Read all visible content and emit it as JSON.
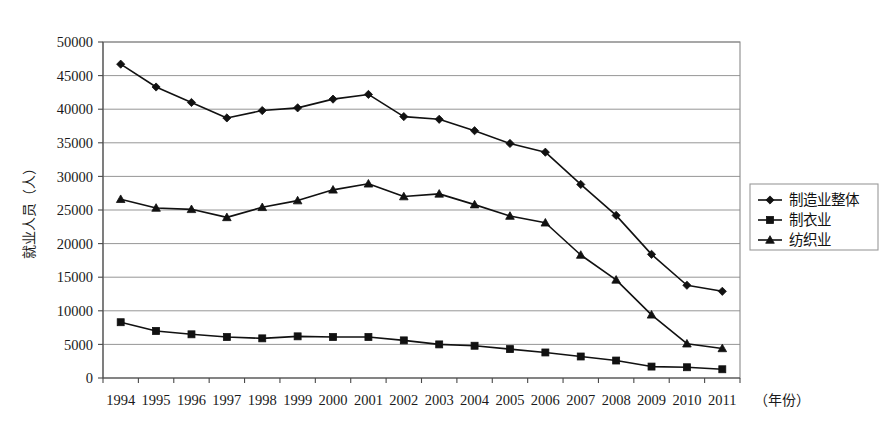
{
  "chart_data": {
    "type": "line",
    "title": "",
    "xlabel": "（年份）",
    "ylabel": "就业人员（人）",
    "categories": [
      "1994",
      "1995",
      "1996",
      "1997",
      "1998",
      "1999",
      "2000",
      "2001",
      "2002",
      "2003",
      "2004",
      "2005",
      "2006",
      "2007",
      "2008",
      "2009",
      "2010",
      "2011"
    ],
    "ylim": [
      0,
      50000
    ],
    "ytick_labels": [
      "50000",
      "45000",
      "40000",
      "35000",
      "30000",
      "25000",
      "20000",
      "15000",
      "10000",
      "5000",
      "0"
    ],
    "ytick_values": [
      50000,
      45000,
      40000,
      35000,
      30000,
      25000,
      20000,
      15000,
      10000,
      5000,
      0
    ],
    "grid": true,
    "legend_position": "right",
    "series": [
      {
        "name": "制造业整体",
        "marker": "diamond",
        "values": [
          46700,
          43300,
          41000,
          38700,
          39800,
          40200,
          41500,
          42200,
          38900,
          38500,
          36800,
          34900,
          33600,
          28800,
          24200,
          18400,
          13800,
          12900
        ]
      },
      {
        "name": "制衣业",
        "marker": "square",
        "values": [
          8300,
          7000,
          6500,
          6100,
          5900,
          6200,
          6100,
          6100,
          5600,
          5000,
          4800,
          4300,
          3800,
          3200,
          2600,
          1700,
          1600,
          1300
        ]
      },
      {
        "name": "纺织业",
        "marker": "triangle",
        "values": [
          26600,
          25300,
          25100,
          23900,
          25400,
          26400,
          28000,
          28900,
          27000,
          27400,
          25800,
          24100,
          23100,
          18300,
          14600,
          9400,
          5100,
          4400
        ]
      }
    ]
  },
  "legend": {
    "items": [
      {
        "label": "制造业整体",
        "marker": "diamond"
      },
      {
        "label": "制衣业",
        "marker": "square"
      },
      {
        "label": "纺织业",
        "marker": "triangle"
      }
    ]
  },
  "colors": {
    "ink": "#111111",
    "grid": "#8a8a8a",
    "background": "#ffffff"
  }
}
